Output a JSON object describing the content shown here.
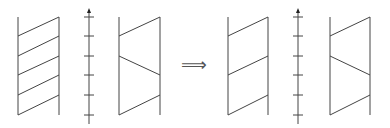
{
  "diagram": {
    "stroke_color": "#444444",
    "transition_symbol": "⟹",
    "before": {
      "strip_left": {
        "left_x": 18,
        "right_x": 59,
        "top_y": 17,
        "bottom_y": 115,
        "segments": [
          {
            "from": [
              18,
              36
            ],
            "to": [
              59,
              17
            ]
          },
          {
            "from": [
              18,
              56
            ],
            "to": [
              59,
              36
            ]
          },
          {
            "from": [
              18,
              75
            ],
            "to": [
              59,
              56
            ]
          },
          {
            "from": [
              18,
              95
            ],
            "to": [
              59,
              75
            ]
          },
          {
            "from": [
              18,
              115
            ],
            "to": [
              59,
              95
            ]
          }
        ]
      },
      "axis": {
        "x": 89,
        "top_y": 8,
        "bottom_y": 124,
        "arrow": "up",
        "ticks_y": [
          17,
          36,
          56,
          75,
          95,
          115
        ]
      },
      "strip_right": {
        "left_x": 119,
        "right_x": 160,
        "top_y": 17,
        "bottom_y": 115,
        "segments": [
          {
            "from": [
              119,
              36
            ],
            "to": [
              160,
              17
            ]
          },
          {
            "from": [
              119,
              56
            ],
            "to": [
              160,
              75
            ]
          },
          {
            "from": [
              119,
              115
            ],
            "to": [
              160,
              95
            ]
          }
        ]
      }
    },
    "after": {
      "strip_left": {
        "left_x": 228,
        "right_x": 268,
        "top_y": 17,
        "bottom_y": 115,
        "segments": [
          {
            "from": [
              228,
              36
            ],
            "to": [
              268,
              17
            ]
          },
          {
            "from": [
              228,
              75
            ],
            "to": [
              268,
              56
            ]
          },
          {
            "from": [
              228,
              115
            ],
            "to": [
              268,
              95
            ]
          }
        ]
      },
      "axis": {
        "x": 298,
        "top_y": 8,
        "bottom_y": 124,
        "arrow": "up",
        "ticks_y": [
          17,
          36,
          56,
          75,
          95,
          115
        ]
      },
      "strip_right": {
        "left_x": 330,
        "right_x": 370,
        "top_y": 17,
        "bottom_y": 115,
        "segments": [
          {
            "from": [
              330,
              36
            ],
            "to": [
              370,
              17
            ]
          },
          {
            "from": [
              330,
              56
            ],
            "to": [
              370,
              75
            ]
          },
          {
            "from": [
              330,
              115
            ],
            "to": [
              370,
              95
            ]
          }
        ]
      }
    }
  }
}
